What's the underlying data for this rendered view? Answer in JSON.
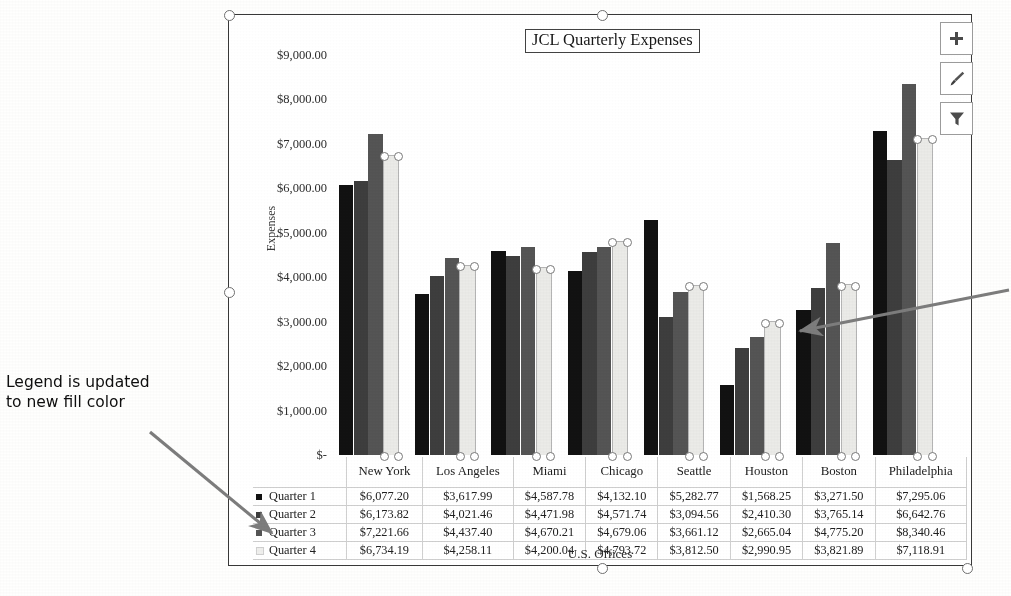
{
  "figure": {
    "cut_off_text_above": "",
    "annotations": [
      {
        "id": "legend-note",
        "text": "Legend is updated\nto new fill color"
      }
    ]
  },
  "chart": {
    "title": "JCL Quarterly Expenses",
    "x_axis_title": "U.S. Offices",
    "y_axis_title": "Expenses",
    "selected_series": "Quarter 4",
    "buttons": [
      {
        "name": "chart-elements-button",
        "icon": "plus-icon",
        "label": "+"
      },
      {
        "name": "chart-styles-button",
        "icon": "paintbrush-icon",
        "label": ""
      },
      {
        "name": "chart-filters-button",
        "icon": "funnel-icon",
        "label": ""
      }
    ]
  },
  "chart_data": {
    "type": "bar",
    "title": "JCL Quarterly Expenses",
    "xlabel": "U.S. Offices",
    "ylabel": "Expenses",
    "ylim": [
      0,
      9000
    ],
    "grid": false,
    "legend": "data table below plot",
    "ytick_labels": [
      "$9,000.00",
      "$8,000.00",
      "$7,000.00",
      "$6,000.00",
      "$5,000.00",
      "$4,000.00",
      "$3,000.00",
      "$2,000.00",
      "$1,000.00",
      "$-"
    ],
    "ytick_values": [
      9000,
      8000,
      7000,
      6000,
      5000,
      4000,
      3000,
      2000,
      1000,
      0
    ],
    "categories": [
      "New York",
      "Los Angeles",
      "Miami",
      "Chicago",
      "Seattle",
      "Houston",
      "Boston",
      "Philadelphia"
    ],
    "series": [
      {
        "name": "Quarter 1",
        "color": "#141414",
        "values": [
          6077.2,
          3617.99,
          4587.78,
          4132.1,
          5282.77,
          1568.25,
          3271.5,
          7295.06
        ],
        "labels": [
          "$6,077.20",
          "$3,617.99",
          "$4,587.78",
          "$4,132.10",
          "$5,282.77",
          "$1,568.25",
          "$3,271.50",
          "$7,295.06"
        ]
      },
      {
        "name": "Quarter 2",
        "color": "#3f3f3f",
        "values": [
          6173.82,
          4021.46,
          4471.98,
          4571.74,
          3094.56,
          2410.3,
          3765.14,
          6642.76
        ],
        "labels": [
          "$6,173.82",
          "$4,021.46",
          "$4,471.98",
          "$4,571.74",
          "$3,094.56",
          "$2,410.30",
          "$3,765.14",
          "$6,642.76"
        ]
      },
      {
        "name": "Quarter 3",
        "color": "#565656",
        "values": [
          7221.66,
          4437.4,
          4670.21,
          4679.06,
          3661.12,
          2665.04,
          4775.2,
          8340.46
        ],
        "labels": [
          "$7,221.66",
          "$4,437.40",
          "$4,670.21",
          "$4,679.06",
          "$3,661.12",
          "$2,665.04",
          "$4,775.20",
          "$8,340.46"
        ]
      },
      {
        "name": "Quarter 4",
        "color": "#e9e9e6",
        "values": [
          6734.19,
          4258.11,
          4200.04,
          4793.72,
          3812.5,
          2990.95,
          3821.89,
          7118.91
        ],
        "labels": [
          "$6,734.19",
          "$4,258.11",
          "$4,200.04",
          "$4,793.72",
          "$3,812.50",
          "$2,990.95",
          "$3,821.89",
          "$7,118.91"
        ]
      }
    ]
  },
  "data_table": {
    "column_headers": [
      "",
      "New York",
      "Los Angeles",
      "Miami",
      "Chicago",
      "Seattle",
      "Houston",
      "Boston",
      "Philadelphia"
    ],
    "rows": [
      {
        "label": "Quarter 1",
        "cells": [
          "$6,077.20",
          "$3,617.99",
          "$4,587.78",
          "$4,132.10",
          "$5,282.77",
          "$1,568.25",
          "$3,271.50",
          "$7,295.06"
        ]
      },
      {
        "label": "Quarter 2",
        "cells": [
          "$6,173.82",
          "$4,021.46",
          "$4,471.98",
          "$4,571.74",
          "$3,094.56",
          "$2,410.30",
          "$3,765.14",
          "$6,642.76"
        ]
      },
      {
        "label": "Quarter 3",
        "cells": [
          "$7,221.66",
          "$4,437.40",
          "$4,670.21",
          "$4,679.06",
          "$3,661.12",
          "$2,665.04",
          "$4,775.20",
          "$8,340.46"
        ]
      },
      {
        "label": "Quarter 4",
        "cells": [
          "$6,734.19",
          "$4,258.11",
          "$4,200.04",
          "$4,793.72",
          "$3,812.50",
          "$2,990.95",
          "$3,821.89",
          "$7,118.91"
        ]
      }
    ]
  }
}
